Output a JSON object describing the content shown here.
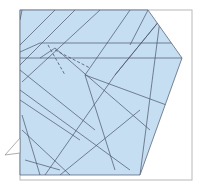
{
  "diagram": {
    "type": "origami-crease-pattern",
    "colors": {
      "paper": "#c5def2",
      "frame": "#b8b8b8",
      "line": "#4a5568",
      "background": "#ffffff"
    },
    "frame": {
      "x": 20,
      "y": 10,
      "w": 172,
      "h": 170
    },
    "paper_polygon": [
      [
        20,
        10
      ],
      [
        148,
        10
      ],
      [
        182,
        58
      ],
      [
        140,
        175
      ],
      [
        20,
        175
      ]
    ],
    "flap_triangle": [
      [
        20,
        138
      ],
      [
        5,
        155
      ],
      [
        20,
        153
      ]
    ],
    "solid_lines": [
      [
        [
          20,
          20
        ],
        [
          22,
          10
        ]
      ],
      [
        [
          20,
          45
        ],
        [
          55,
          10
        ]
      ],
      [
        [
          20,
          65
        ],
        [
          75,
          10
        ]
      ],
      [
        [
          22,
          82
        ],
        [
          100,
          10
        ]
      ],
      [
        [
          20,
          52
        ],
        [
          40,
          43
        ],
        [
          200,
          43
        ]
      ],
      [
        [
          20,
          58
        ],
        [
          182,
          58
        ]
      ],
      [
        [
          40,
          58
        ],
        [
          55,
          48
        ],
        [
          150,
          130
        ]
      ],
      [
        [
          20,
          70
        ],
        [
          95,
          130
        ]
      ],
      [
        [
          20,
          90
        ],
        [
          130,
          170
        ]
      ],
      [
        [
          20,
          100
        ],
        [
          80,
          140
        ]
      ],
      [
        [
          22,
          115
        ],
        [
          40,
          175
        ]
      ],
      [
        [
          22,
          130
        ],
        [
          70,
          175
        ]
      ],
      [
        [
          45,
          175
        ],
        [
          115,
          75
        ],
        [
          160,
          20
        ]
      ],
      [
        [
          85,
          75
        ],
        [
          130,
          10
        ]
      ],
      [
        [
          85,
          75
        ],
        [
          115,
          170
        ]
      ],
      [
        [
          115,
          75
        ],
        [
          160,
          20
        ],
        [
          140,
          175
        ]
      ],
      [
        [
          130,
          45
        ],
        [
          148,
          10
        ]
      ],
      [
        [
          85,
          75
        ],
        [
          180,
          110
        ]
      ],
      [
        [
          60,
          175
        ],
        [
          140,
          110
        ]
      ],
      [
        [
          25,
          160
        ],
        [
          60,
          170
        ]
      ]
    ],
    "dashed_lines": [
      [
        [
          48,
          45
        ],
        [
          65,
          75
        ]
      ],
      [
        [
          55,
          50
        ],
        [
          90,
          68
        ]
      ]
    ]
  }
}
